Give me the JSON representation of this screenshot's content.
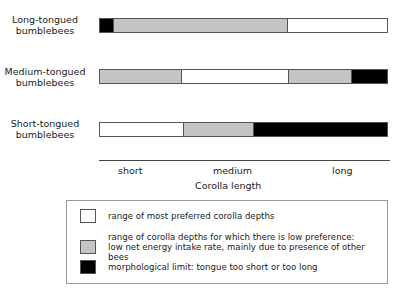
{
  "colors": {
    "preferred": "#ffffff",
    "low": "#c4c4c4",
    "limit": "#000000"
  },
  "rows": [
    {
      "label_line1": "Long-tongued",
      "label_line2": "bumblebees",
      "segments": [
        {
          "type": "limit",
          "width": 14
        },
        {
          "type": "low",
          "width": 175
        },
        {
          "type": "preferred",
          "width": 100
        }
      ]
    },
    {
      "label_line1": "Medium-tongued",
      "label_line2": "bumblebees",
      "segments": [
        {
          "type": "low",
          "width": 83
        },
        {
          "type": "preferred",
          "width": 107
        },
        {
          "type": "low",
          "width": 64
        },
        {
          "type": "limit",
          "width": 35
        }
      ]
    },
    {
      "label_line1": "Short-tongued",
      "label_line2": "bumblebees",
      "segments": [
        {
          "type": "preferred",
          "width": 85
        },
        {
          "type": "low",
          "width": 70
        },
        {
          "type": "limit",
          "width": 134
        }
      ]
    }
  ],
  "axis": {
    "ticks": [
      "short",
      "medium",
      "long"
    ],
    "label": "Corolla length"
  },
  "legend": [
    {
      "type": "preferred",
      "line1": "range of most preferred corolla depths",
      "line2": ""
    },
    {
      "type": "low",
      "line1": "range of corolla depths for which there is low preference:",
      "line2": "low net energy intake rate, mainly due to presence of other bees"
    },
    {
      "type": "limit",
      "line1": "morphological limit: tongue too short or too long",
      "line2": ""
    }
  ],
  "chart_data": {
    "type": "bar",
    "title": "",
    "xlabel": "Corolla length",
    "x_ticks": [
      "short",
      "medium",
      "long"
    ],
    "categories": [
      "Long-tongued bumblebees",
      "Medium-tongued bumblebees",
      "Short-tongued bumblebees"
    ],
    "series": [
      {
        "name": "Long-tongued bumblebees",
        "segments": [
          [
            "morphological limit",
            0,
            5
          ],
          [
            "low preference",
            5,
            65
          ],
          [
            "most preferred",
            65,
            100
          ]
        ]
      },
      {
        "name": "Medium-tongued bumblebees",
        "segments": [
          [
            "low preference",
            0,
            29
          ],
          [
            "most preferred",
            29,
            66
          ],
          [
            "low preference",
            66,
            88
          ],
          [
            "morphological limit",
            88,
            100
          ]
        ]
      },
      {
        "name": "Short-tongued bumblebees",
        "segments": [
          [
            "most preferred",
            0,
            29
          ],
          [
            "low preference",
            29,
            54
          ],
          [
            "morphological limit",
            54,
            100
          ]
        ]
      }
    ]
  }
}
